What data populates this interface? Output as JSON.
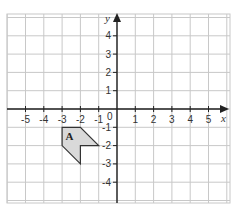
{
  "figure": {
    "x_axis_label": "x",
    "y_axis_label": "y",
    "origin_label": "0",
    "x_ticks": [
      -5,
      -4,
      -3,
      -2,
      -1,
      1,
      2,
      3,
      4,
      5
    ],
    "y_ticks": [
      4,
      3,
      2,
      1,
      -1,
      -2,
      -3,
      -4
    ],
    "grid": {
      "x_min": -6,
      "x_max": 6,
      "y_min": -5,
      "y_max": 5
    },
    "shapes": [
      {
        "label": "A",
        "vertices": [
          [
            -3,
            -1
          ],
          [
            -2,
            -1
          ],
          [
            -1,
            -2
          ],
          [
            -2,
            -2
          ],
          [
            -2,
            -3
          ],
          [
            -3,
            -2
          ]
        ],
        "label_position": [
          -2.6,
          -1.5
        ],
        "fill": "#d9d9d9",
        "stroke": "#333333"
      }
    ]
  },
  "colors": {
    "grid": "#c8c8c8",
    "axis": "#222222"
  }
}
